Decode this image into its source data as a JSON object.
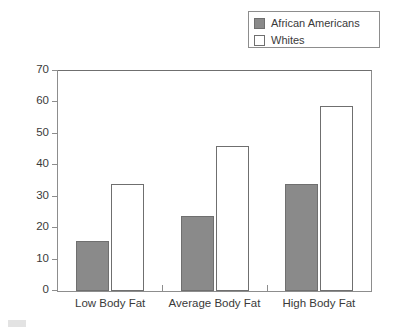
{
  "chart_data": {
    "type": "bar",
    "title": "",
    "xlabel": "",
    "ylabel": "Percentage Dieting",
    "ylim": [
      0,
      70
    ],
    "yticks": [
      0,
      10,
      20,
      30,
      40,
      50,
      60,
      70
    ],
    "grid": false,
    "legend_position": "top-right",
    "categories": [
      "Low Body Fat",
      "Average Body Fat",
      "High Body Fat"
    ],
    "series": [
      {
        "name": "African Americans",
        "color": "#8a8a8a",
        "values": [
          16,
          24,
          34
        ]
      },
      {
        "name": "Whites",
        "color": "#ffffff",
        "values": [
          34,
          46,
          59
        ]
      }
    ]
  },
  "legend": {
    "entries": [
      {
        "label": "African Americans",
        "swatch": "filled-gray-square-icon"
      },
      {
        "label": "Whites",
        "swatch": "empty-white-square-icon"
      }
    ]
  },
  "axes": {
    "y": {
      "title": "Percentage Dieting",
      "tick_labels": [
        "0",
        "10",
        "20",
        "30",
        "40",
        "50",
        "60",
        "70"
      ]
    },
    "x": {
      "tick_labels": [
        "Low Body Fat",
        "Average Body Fat",
        "High Body Fat"
      ]
    }
  },
  "colors": {
    "bar_gray": "#8a8a8a",
    "bar_white": "#ffffff",
    "frame": "#8d8d8d",
    "text": "#3a3a3a",
    "background": "#ffffff"
  }
}
